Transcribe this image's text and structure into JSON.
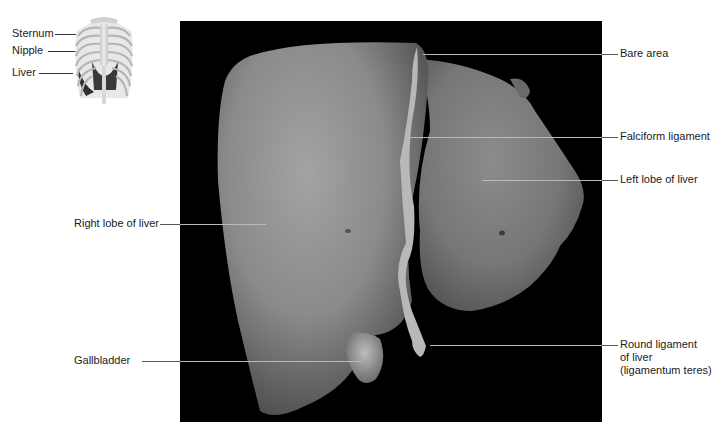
{
  "figure": {
    "inset": {
      "description": "Anterior thorax rib cage with liver highlighted",
      "labels": [
        {
          "text": "Sternum",
          "x": 12,
          "y": 33
        },
        {
          "text": "Nipple",
          "x": 12,
          "y": 50
        },
        {
          "text": "Liver",
          "x": 12,
          "y": 73
        }
      ]
    },
    "photo": {
      "description": "Anterior view of cadaveric liver on black background"
    },
    "labels_right": [
      {
        "text": "Bare area",
        "y": 54
      },
      {
        "text": "Falciform ligament",
        "y": 137
      },
      {
        "text": "Left lobe of liver",
        "y": 180
      },
      {
        "text": "Round ligament",
        "line2": "of liver",
        "line3": "(ligamentum teres)",
        "y": 345
      }
    ],
    "labels_left": [
      {
        "text": "Right lobe of liver",
        "y": 224
      },
      {
        "text": "Gallbladder",
        "y": 361
      }
    ]
  }
}
